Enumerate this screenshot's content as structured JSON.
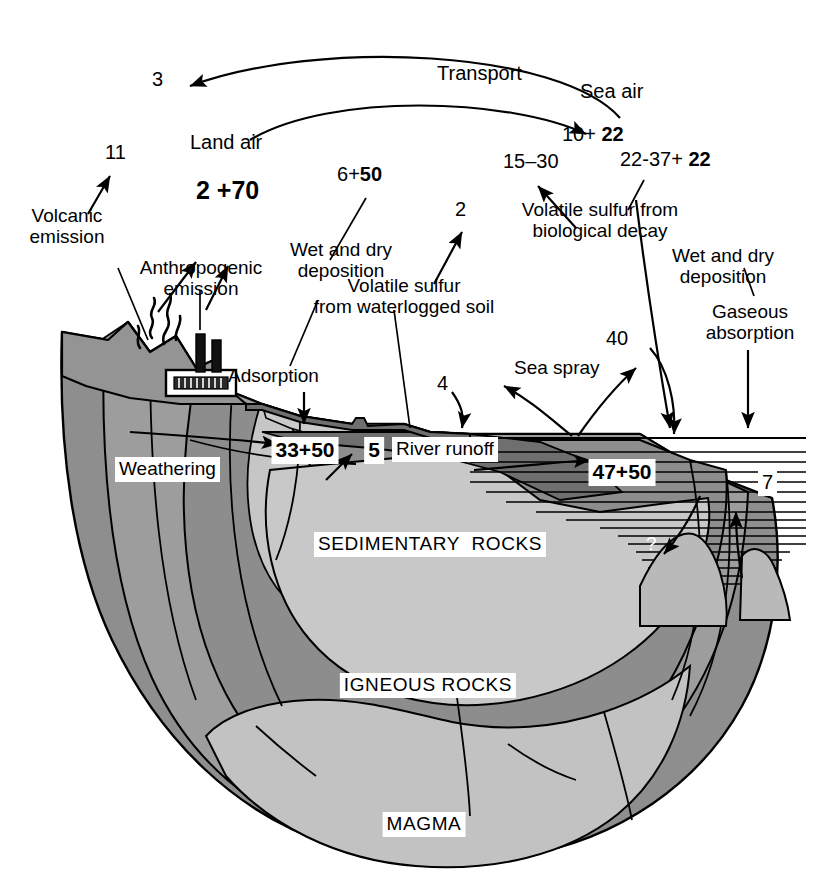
{
  "diagram": {
    "compartments": {
      "land_air": "Land air",
      "sea_air": "Sea air",
      "sedimentary_rocks": "SEDIMENTARY  ROCKS",
      "igneous_rocks": "IGNEOUS ROCKS",
      "magma": "MAGMA"
    },
    "process_labels": {
      "transport": "Transport",
      "volcanic_emission": "Volcanic\nemission",
      "anthropogenic_emission": "Anthropogenic\nemission",
      "wet_dry_deposition_left": "Wet and dry\ndeposition",
      "adsorption": "Adsorption",
      "volatile_sulfur_soil": "Volatile sulfur\nfrom waterlogged soil",
      "volatile_sulfur_decay": "Volatile sulfur from\nbiological decay",
      "wet_dry_deposition_right": "Wet and dry\ndeposition",
      "gaseous_absorption": "Gaseous\nabsorption",
      "sea_spray": "Sea spray",
      "river_runoff": "River runoff",
      "weathering": "Weathering"
    },
    "flux_values": {
      "transport_to_land": "3",
      "volcanic": "11",
      "land_air_pool": "2 +70",
      "land_air_pool_natural": "2",
      "land_air_pool_anthropogenic": "+70",
      "wet_dry_deposition_land": "6+50",
      "wet_dry_deposition_land_natural": "6",
      "wet_dry_deposition_land_anthropogenic": "50",
      "volatile_soil": "2",
      "sea_air_pool": "10+ 22",
      "sea_air_pool_natural": "10+",
      "sea_air_pool_anthropogenic": "22",
      "biological_decay": "15–30",
      "deposition_sea": "22-37+ 22",
      "deposition_sea_natural": "22-37+",
      "deposition_sea_anthropogenic": "22",
      "sea_spray_up": "40",
      "sea_spray_down": "4",
      "adsorption_sediment": "33+50",
      "adsorption_sediment_natural": "33+",
      "adsorption_sediment_anthropogenic": "50",
      "river_runoff_value": "5",
      "ocean_pool": "47+50",
      "ocean_pool_natural": "47+",
      "ocean_pool_anthropogenic": "50",
      "hydrothermal": "7",
      "unknown_burial": "?"
    },
    "colors": {
      "ink": "#000000",
      "background": "#ffffff",
      "crust_dark": "#8a8a8a",
      "crust_mid": "#a3a3a3",
      "sediment_light": "#c9c9c9",
      "magma_light": "#bdbdbd",
      "seafloor_shade": "#707070",
      "mountain": "#949494",
      "water_line": "#000000"
    }
  }
}
